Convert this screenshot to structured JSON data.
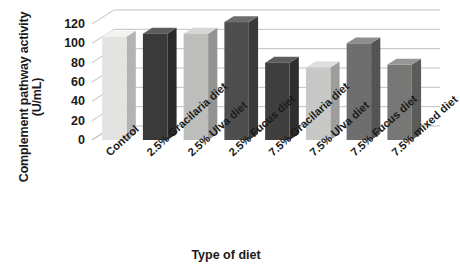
{
  "chart_data": {
    "type": "bar",
    "title": "",
    "xlabel": "Type of diet",
    "ylabel": "Complement pathway activity",
    "ylabel_line1": "Complement pathway activity",
    "ylabel_line2": "(U/mL)",
    "yunits": "U/mL",
    "categories": [
      "Control",
      "2.5% Gracilaria diet",
      "2.5% Ulva diet",
      "2.5% Fucus diet",
      "7.5% Gracilaria diet",
      "7.5% Ulva diet",
      "7.5% Fucus diet",
      "7.5% mixed diet"
    ],
    "values": [
      107,
      110,
      110,
      122,
      80,
      75,
      100,
      78
    ],
    "yticks": [
      0,
      20,
      40,
      60,
      80,
      100,
      120
    ],
    "ytick_labels": [
      "0",
      "20",
      "40",
      "60",
      "80",
      "100",
      "120"
    ],
    "ylim": [
      0,
      120
    ],
    "grid": true,
    "legend": "none",
    "style": "3d-column",
    "bar_colors": [
      "#e3e3e1",
      "#3a3a3a",
      "#bdbdbb",
      "#4e4e4e",
      "#3f3f3f",
      "#c8c8c6",
      "#6e6e6e",
      "#777775"
    ],
    "bar_side_colors": [
      "#b4b4b2",
      "#2a2a2a",
      "#939391",
      "#3a3a3a",
      "#2e2e2e",
      "#9d9d9b",
      "#545452",
      "#5b5b59"
    ],
    "bar_top_colors": [
      "#f2f2f0",
      "#5c5c5c",
      "#d6d6d4",
      "#6e6e6e",
      "#5e5e5e",
      "#dedede",
      "#8e8e8c",
      "#969694"
    ],
    "axis_color": "#a6a6a4",
    "grid_color": "#b9b9b7",
    "background": "#ffffff"
  }
}
